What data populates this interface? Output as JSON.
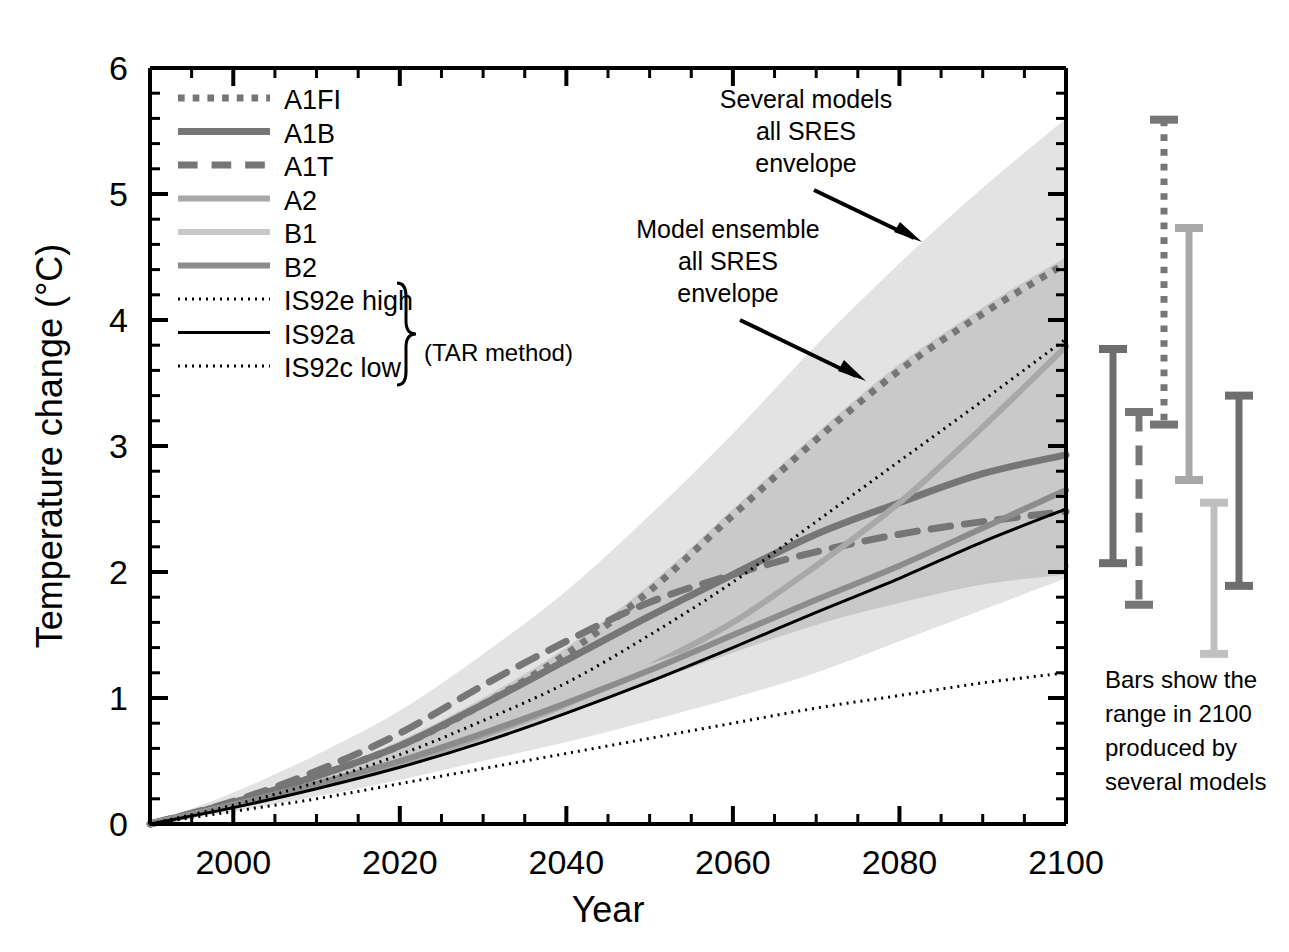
{
  "chart_data": {
    "type": "line",
    "title": "",
    "xlabel": "Year",
    "ylabel": "Temperature change (°C)",
    "xlim": [
      1990,
      2100
    ],
    "ylim": [
      0,
      6
    ],
    "xticks": [
      2000,
      2020,
      2040,
      2060,
      2080,
      2100
    ],
    "yticks": [
      0,
      1,
      2,
      3,
      4,
      5,
      6
    ],
    "grid": false,
    "minor_ticks": true,
    "legend_position": "upper-left",
    "x": [
      1990,
      2000,
      2010,
      2020,
      2030,
      2040,
      2050,
      2060,
      2070,
      2080,
      2090,
      2100
    ],
    "series": [
      {
        "name": "A1FI",
        "style": "dotted",
        "color": "#767676",
        "width": 7,
        "values": [
          0.0,
          0.17,
          0.38,
          0.62,
          0.95,
          1.35,
          1.85,
          2.45,
          3.05,
          3.6,
          4.05,
          4.45
        ]
      },
      {
        "name": "A1B",
        "style": "solid",
        "color": "#767676",
        "width": 7,
        "values": [
          0.0,
          0.17,
          0.38,
          0.62,
          0.95,
          1.3,
          1.65,
          1.98,
          2.3,
          2.55,
          2.78,
          2.93
        ]
      },
      {
        "name": "A1T",
        "style": "dashed",
        "color": "#767676",
        "width": 7,
        "values": [
          0.0,
          0.18,
          0.42,
          0.72,
          1.1,
          1.45,
          1.76,
          1.98,
          2.16,
          2.3,
          2.4,
          2.48
        ]
      },
      {
        "name": "A2",
        "style": "solid",
        "color": "#a8a8a8",
        "width": 6,
        "values": [
          0.0,
          0.15,
          0.3,
          0.48,
          0.7,
          0.95,
          1.25,
          1.6,
          2.05,
          2.55,
          3.15,
          3.79
        ]
      },
      {
        "name": "B1",
        "style": "solid",
        "color": "#c8c8c8",
        "width": 6,
        "values": [
          0.0,
          0.15,
          0.32,
          0.52,
          0.78,
          1.02,
          1.25,
          1.45,
          1.62,
          1.78,
          1.93,
          2.05
        ]
      },
      {
        "name": "B2",
        "style": "solid",
        "color": "#8c8c8c",
        "width": 6,
        "values": [
          0.0,
          0.15,
          0.32,
          0.5,
          0.72,
          0.96,
          1.22,
          1.5,
          1.78,
          2.05,
          2.35,
          2.65
        ]
      },
      {
        "name": "IS92e high",
        "style": "dotted",
        "color": "#000000",
        "width": 3,
        "values": [
          0.0,
          0.15,
          0.33,
          0.55,
          0.82,
          1.12,
          1.5,
          1.92,
          2.4,
          2.88,
          3.36,
          3.85
        ]
      },
      {
        "name": "IS92a",
        "style": "solid",
        "color": "#000000",
        "width": 3,
        "values": [
          0.0,
          0.13,
          0.28,
          0.45,
          0.65,
          0.88,
          1.13,
          1.4,
          1.68,
          1.95,
          2.24,
          2.5
        ]
      },
      {
        "name": "IS92c low",
        "style": "dotted",
        "color": "#000000",
        "width": 3,
        "values": [
          0.0,
          0.1,
          0.2,
          0.32,
          0.44,
          0.56,
          0.68,
          0.8,
          0.92,
          1.02,
          1.12,
          1.2
        ]
      }
    ],
    "envelopes": [
      {
        "name": "Several models all SRES envelope",
        "color": "#e3e3e3",
        "upper": [
          0.0,
          0.25,
          0.55,
          0.9,
          1.35,
          1.85,
          2.45,
          3.1,
          3.8,
          4.45,
          5.05,
          5.6
        ],
        "lower": [
          0.0,
          0.1,
          0.22,
          0.35,
          0.5,
          0.65,
          0.82,
          1.0,
          1.2,
          1.45,
          1.7,
          1.95
        ]
      },
      {
        "name": "Model ensemble all SRES envelope",
        "color": "#c9c9c9",
        "upper": [
          0.0,
          0.18,
          0.4,
          0.66,
          1.0,
          1.4,
          1.9,
          2.5,
          3.1,
          3.65,
          4.1,
          4.5
        ],
        "lower": [
          0.0,
          0.13,
          0.28,
          0.45,
          0.65,
          0.88,
          1.12,
          1.36,
          1.58,
          1.76,
          1.9,
          1.98
        ]
      }
    ],
    "bars_2100": {
      "caption": "Bars show the range in 2100 produced by several models",
      "items": [
        {
          "name": "A1B",
          "style": "solid",
          "color": "#6e6e6e",
          "low": 2.07,
          "high": 3.77
        },
        {
          "name": "A1T",
          "style": "dashed",
          "color": "#767676",
          "low": 1.74,
          "high": 3.27
        },
        {
          "name": "A1FI",
          "style": "dotted",
          "color": "#767676",
          "low": 3.17,
          "high": 5.59
        },
        {
          "name": "A2",
          "style": "solid",
          "color": "#a8a8a8",
          "low": 2.73,
          "high": 4.73
        },
        {
          "name": "B1",
          "style": "solid",
          "color": "#c0c0c0",
          "low": 1.35,
          "high": 2.55
        },
        {
          "name": "B2",
          "style": "solid",
          "color": "#6e6e6e",
          "low": 1.89,
          "high": 3.4
        }
      ]
    },
    "annotations": [
      {
        "name": "several-models-annotation",
        "lines": [
          "Several models",
          "all SRES",
          "envelope"
        ]
      },
      {
        "name": "model-ensemble-annotation",
        "lines": [
          "Model ensemble",
          "all SRES",
          "envelope"
        ]
      }
    ]
  },
  "axis": {
    "y_title": "Temperature change (°C)",
    "x_title": "Year",
    "y_tick_labels": [
      "6",
      "5",
      "4",
      "3",
      "2",
      "1",
      "0"
    ],
    "x_tick_labels": [
      "2000",
      "2020",
      "2040",
      "2060",
      "2080",
      "2100"
    ]
  },
  "legend": {
    "items": [
      {
        "label": "A1FI",
        "style": "dotted",
        "color": "#767676",
        "width": 7
      },
      {
        "label": "A1B",
        "style": "solid",
        "color": "#767676",
        "width": 7
      },
      {
        "label": "A1T",
        "style": "dashed",
        "color": "#767676",
        "width": 7
      },
      {
        "label": "A2",
        "style": "solid",
        "color": "#a8a8a8",
        "width": 6
      },
      {
        "label": "B1",
        "style": "solid",
        "color": "#c8c8c8",
        "width": 6
      },
      {
        "label": "B2",
        "style": "solid",
        "color": "#8c8c8c",
        "width": 6
      },
      {
        "label": "IS92e high",
        "style": "dotted",
        "color": "#000000",
        "width": 3
      },
      {
        "label": "IS92a",
        "style": "solid",
        "color": "#000000",
        "width": 3
      },
      {
        "label": "IS92c low",
        "style": "dotted",
        "color": "#000000",
        "width": 3
      }
    ],
    "brace_note": "(TAR method)"
  },
  "annotations": {
    "several_models": "Several models\nall SRES\nenvelope",
    "several_models_l1": "Several models",
    "several_models_l2": "all SRES",
    "several_models_l3": "envelope",
    "model_ensemble_l1": "Model ensemble",
    "model_ensemble_l2": "all SRES",
    "model_ensemble_l3": "envelope",
    "bars_note_l1": "Bars show the",
    "bars_note_l2": "range in 2100",
    "bars_note_l3": "produced by",
    "bars_note_l4": "several models"
  }
}
